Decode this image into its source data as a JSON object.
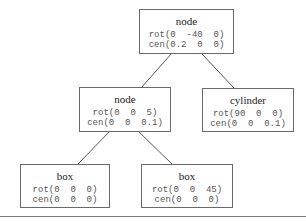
{
  "diagram": {
    "type": "scene-graph-tree",
    "nodes": [
      {
        "id": "root",
        "label": "node",
        "rot": "rot(0  -40  0)",
        "cen": "cen(0.2  0  0)",
        "parent": null
      },
      {
        "id": "mid",
        "label": "node",
        "rot": "rot(0  0  5)",
        "cen": "cen(0  0  0.1)",
        "parent": "root"
      },
      {
        "id": "cyl",
        "label": "cylinder",
        "rot": "rot(90  0  0)",
        "cen": "cen(0  0  0.1)",
        "parent": "root"
      },
      {
        "id": "box1",
        "label": "box",
        "rot": "rot(0  0  0)",
        "cen": "cen(0  0  0)",
        "parent": "mid"
      },
      {
        "id": "box2",
        "label": "box",
        "rot": "rot(0  0  45)",
        "cen": "cen(0  0  0)",
        "parent": "mid"
      }
    ],
    "colors": {
      "border": "#6a6a6a",
      "edge": "#555555",
      "text": "#222222"
    }
  }
}
